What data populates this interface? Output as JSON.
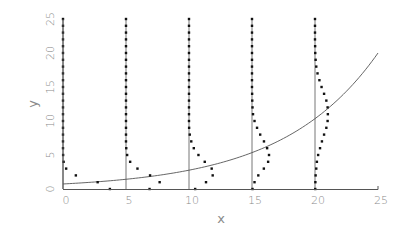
{
  "chart_data": {
    "type": "scatter",
    "title": "",
    "xlabel": "x",
    "ylabel": "y",
    "xlim": [
      0,
      25
    ],
    "ylim": [
      0,
      25
    ],
    "grid": false,
    "legend": null,
    "x_ticks": [
      "0",
      "5",
      "10",
      "15",
      "20",
      "25"
    ],
    "y_ticks": [
      "0",
      "5",
      "10",
      "15",
      "20",
      "25"
    ],
    "vertical_reference_lines": [
      0,
      5,
      10,
      15,
      20
    ],
    "curve": {
      "type": "line",
      "description": "exponential mean curve",
      "x": [
        0,
        2.5,
        5,
        7.5,
        10,
        12.5,
        15,
        17.5,
        20,
        22.5,
        25
      ],
      "y": [
        0.74,
        1.03,
        1.43,
        1.99,
        2.77,
        3.85,
        5.36,
        7.45,
        10.36,
        14.4,
        20.0
      ]
    },
    "series": [
      {
        "name": "distribution at x=0",
        "base_x": 0,
        "points": [
          [
            3.72,
            0
          ],
          [
            2.75,
            1
          ],
          [
            1.02,
            2
          ],
          [
            0.25,
            3
          ],
          [
            0.05,
            4
          ],
          [
            0.01,
            5
          ],
          [
            0,
            6
          ],
          [
            0,
            7
          ],
          [
            0,
            8
          ],
          [
            0,
            9
          ],
          [
            0,
            10
          ],
          [
            0,
            11
          ],
          [
            0,
            12
          ],
          [
            0,
            13
          ],
          [
            0,
            14
          ],
          [
            0,
            15
          ],
          [
            0,
            16
          ],
          [
            0,
            17
          ],
          [
            0,
            18
          ],
          [
            0,
            19
          ],
          [
            0,
            20
          ],
          [
            0,
            21
          ],
          [
            0,
            22
          ],
          [
            0,
            23
          ],
          [
            0,
            24
          ],
          [
            0,
            25
          ]
        ]
      },
      {
        "name": "distribution at x=5",
        "base_x": 5,
        "points": [
          [
            6.87,
            0
          ],
          [
            7.67,
            1
          ],
          [
            6.91,
            2
          ],
          [
            5.91,
            3
          ],
          [
            5.33,
            4
          ],
          [
            5.09,
            5
          ],
          [
            5.02,
            6
          ],
          [
            5,
            7
          ],
          [
            5,
            8
          ],
          [
            5,
            9
          ],
          [
            5,
            10
          ],
          [
            5,
            11
          ],
          [
            5,
            12
          ],
          [
            5,
            13
          ],
          [
            5,
            14
          ],
          [
            5,
            15
          ],
          [
            5,
            16
          ],
          [
            5,
            17
          ],
          [
            5,
            18
          ],
          [
            5,
            19
          ],
          [
            5,
            20
          ],
          [
            5,
            21
          ],
          [
            5,
            22
          ],
          [
            5,
            23
          ],
          [
            5,
            24
          ],
          [
            5,
            25
          ]
        ]
      },
      {
        "name": "distribution at x=10",
        "base_x": 10,
        "points": [
          [
            10.49,
            0
          ],
          [
            11.35,
            1
          ],
          [
            11.88,
            2
          ],
          [
            11.8,
            3
          ],
          [
            11.25,
            4
          ],
          [
            10.75,
            5
          ],
          [
            10.38,
            6
          ],
          [
            10.18,
            7
          ],
          [
            10.06,
            8
          ],
          [
            10.01,
            9
          ],
          [
            10,
            10
          ],
          [
            10,
            11
          ],
          [
            10,
            12
          ],
          [
            10,
            13
          ],
          [
            10,
            14
          ],
          [
            10,
            15
          ],
          [
            10,
            16
          ],
          [
            10,
            17
          ],
          [
            10,
            18
          ],
          [
            10,
            19
          ],
          [
            10,
            20
          ],
          [
            10,
            21
          ],
          [
            10,
            22
          ],
          [
            10,
            23
          ],
          [
            10,
            24
          ],
          [
            10,
            25
          ]
        ]
      },
      {
        "name": "distribution at x=15",
        "base_x": 15,
        "points": [
          [
            15.04,
            0
          ],
          [
            15.2,
            1
          ],
          [
            15.5,
            2
          ],
          [
            15.94,
            3
          ],
          [
            16.28,
            4
          ],
          [
            16.35,
            5
          ],
          [
            16.2,
            6
          ],
          [
            15.95,
            7
          ],
          [
            15.65,
            8
          ],
          [
            15.4,
            9
          ],
          [
            15.2,
            10
          ],
          [
            15.08,
            11
          ],
          [
            15.04,
            12
          ],
          [
            15.02,
            13
          ],
          [
            15.01,
            14
          ],
          [
            15,
            15
          ],
          [
            15,
            16
          ],
          [
            15,
            17
          ],
          [
            15,
            18
          ],
          [
            15,
            19
          ],
          [
            15,
            20
          ],
          [
            15,
            21
          ],
          [
            15,
            22
          ],
          [
            15,
            23
          ],
          [
            15,
            24
          ],
          [
            15,
            25
          ]
        ]
      },
      {
        "name": "distribution at x=20",
        "base_x": 20,
        "points": [
          [
            20.02,
            0
          ],
          [
            20.03,
            1
          ],
          [
            20.05,
            2
          ],
          [
            20.1,
            3
          ],
          [
            20.15,
            4
          ],
          [
            20.25,
            5
          ],
          [
            20.4,
            6
          ],
          [
            20.55,
            7
          ],
          [
            20.72,
            8
          ],
          [
            20.9,
            9
          ],
          [
            21.0,
            10
          ],
          [
            21.02,
            11
          ],
          [
            21.0,
            12
          ],
          [
            20.9,
            13
          ],
          [
            20.72,
            14
          ],
          [
            20.52,
            15
          ],
          [
            20.35,
            16
          ],
          [
            20.2,
            17
          ],
          [
            20.1,
            18
          ],
          [
            20.05,
            19
          ],
          [
            20.02,
            20
          ],
          [
            20.01,
            21
          ],
          [
            20,
            22
          ],
          [
            20,
            23
          ],
          [
            20,
            24
          ],
          [
            20,
            25
          ]
        ]
      }
    ]
  }
}
